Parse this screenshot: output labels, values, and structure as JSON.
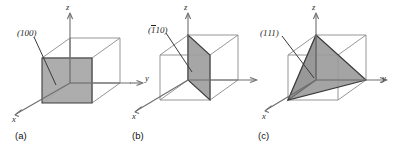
{
  "figure": {
    "background_color": "#ffffff",
    "plane_fill_color": "#a6a6a6",
    "edge_color": "#8a8a8a",
    "axis_color": "#6e6e6e",
    "text_color": "#1f1f1f"
  },
  "panels": [
    {
      "id": "a",
      "caption": "(a)",
      "plane_label": "(100)",
      "plane_label_parts": {
        "prefix": "(1",
        "overbar": "",
        "suffix": "00)"
      },
      "plane_type": "square-face",
      "axes": {
        "x": "x",
        "y": "y",
        "z": "z"
      }
    },
    {
      "id": "b",
      "caption": "(b)",
      "plane_label": "(110)",
      "plane_label_parts": {
        "prefix": "(",
        "overbar": "1",
        "suffix": "10)"
      },
      "plane_type": "diagonal-rectangle",
      "axes": {
        "x": "x",
        "y": "y",
        "z": "z"
      }
    },
    {
      "id": "c",
      "caption": "(c)",
      "plane_label": "(111)",
      "plane_label_parts": {
        "prefix": "(1",
        "overbar": "",
        "suffix": "11)"
      },
      "plane_type": "triangle",
      "axes": {
        "x": "x",
        "y": "y",
        "z": "z"
      }
    }
  ]
}
